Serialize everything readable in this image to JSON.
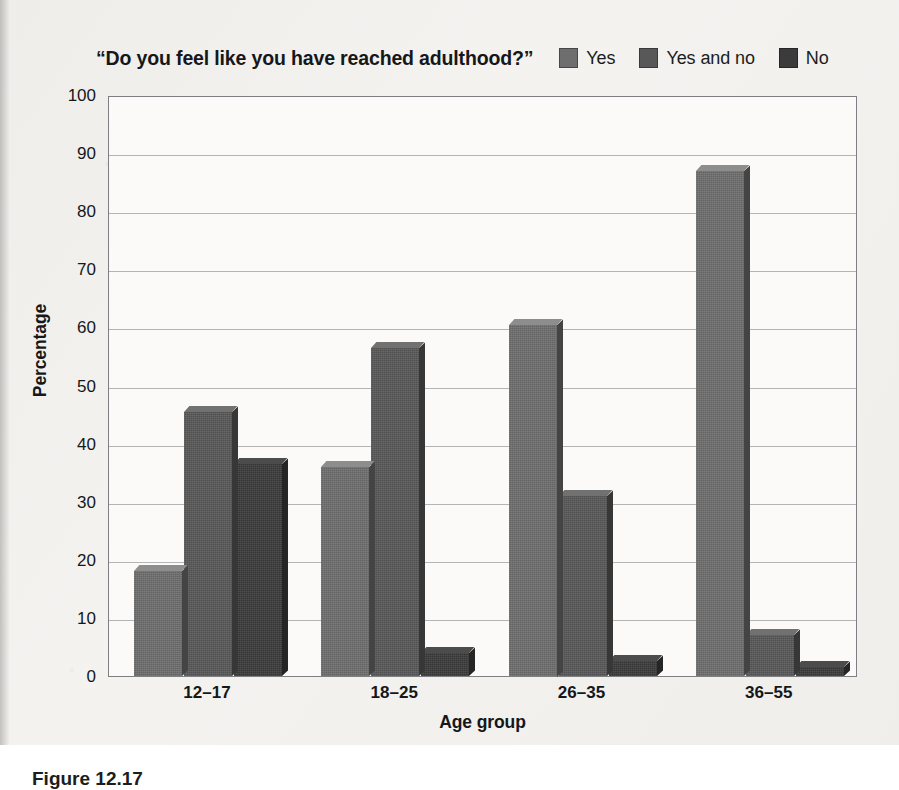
{
  "chart_data": {
    "type": "bar",
    "title": "“Do you feel like you have reached adulthood?”",
    "xlabel": "Age group",
    "ylabel": "Percentage",
    "categories": [
      "12–17",
      "18–25",
      "26–35",
      "36–55"
    ],
    "series": [
      {
        "name": "Yes",
        "values": [
          18,
          36,
          60.5,
          87
        ],
        "color": "#6e6e6e"
      },
      {
        "name": "Yes and no",
        "values": [
          45.5,
          56.5,
          31,
          7
        ],
        "color": "#585858"
      },
      {
        "name": "No",
        "values": [
          36.5,
          4,
          2.5,
          1.5
        ],
        "color": "#3b3b3b"
      }
    ],
    "ylim": [
      0,
      100
    ],
    "yticks": [
      0,
      10,
      20,
      30,
      40,
      50,
      60,
      70,
      80,
      90,
      100
    ],
    "ytick_labels": [
      "0",
      "10",
      "20",
      "30",
      "40",
      "50",
      "60",
      "70",
      "80",
      "90",
      "100"
    ],
    "grid": true,
    "legend_position": "top-right",
    "orientation": "vertical",
    "bar_style": "3d-extruded"
  },
  "legend": {
    "items": [
      {
        "label": "Yes",
        "swatch_color": "#6e6e6e",
        "icon": "legend-swatch-icon"
      },
      {
        "label": "Yes and no",
        "swatch_color": "#585858",
        "icon": "legend-swatch-icon"
      },
      {
        "label": "No",
        "swatch_color": "#3b3b3b",
        "icon": "legend-swatch-icon"
      }
    ]
  },
  "figure": {
    "caption": "Figure 12.17"
  },
  "colors": {
    "plot_background": "#fbfaf8",
    "page_background": "#f2f1ee",
    "frame": "#7d7f82",
    "gridline": "#9a9ca0",
    "text": "#15171a"
  }
}
